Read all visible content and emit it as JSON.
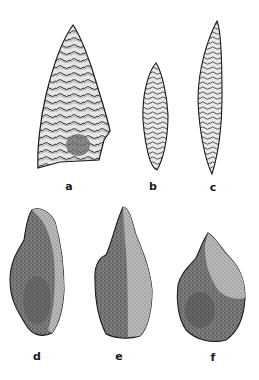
{
  "figure": {
    "artifacts": [
      {
        "id": "a",
        "label": "a",
        "kind": "broad-point",
        "label_pos": [
          69,
          186
        ]
      },
      {
        "id": "b",
        "label": "b",
        "kind": "small-leaf-point",
        "label_pos": [
          153,
          186
        ]
      },
      {
        "id": "c",
        "label": "c",
        "kind": "long-blade-point",
        "label_pos": [
          213,
          187
        ]
      },
      {
        "id": "d",
        "label": "d",
        "kind": "scraper",
        "label_pos": [
          37,
          356
        ]
      },
      {
        "id": "e",
        "label": "e",
        "kind": "borer",
        "label_pos": [
          119,
          356
        ]
      },
      {
        "id": "f",
        "label": "f",
        "kind": "flake-tool",
        "label_pos": [
          213,
          357
        ]
      }
    ],
    "colors": {
      "background": "#ffffff",
      "ink": "#1a1a1a",
      "shade": "#6e6e6e",
      "light": "#d8d8d8"
    }
  }
}
